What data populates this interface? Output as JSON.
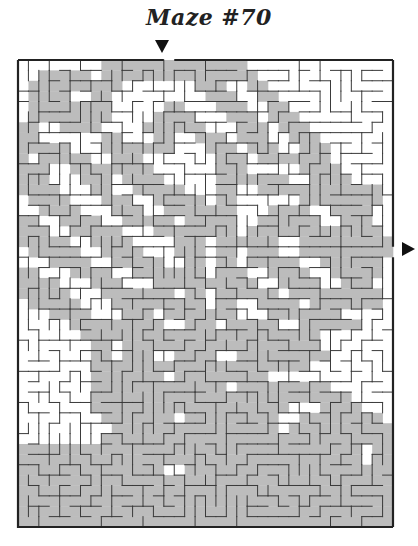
{
  "title": "Maze #70",
  "maze": {
    "cols": 36,
    "rows": 45,
    "cell_px": 10.4,
    "entrance": {
      "side": "top",
      "col": 14,
      "icon": "arrow-down-icon"
    },
    "exit": {
      "side": "right",
      "row": 18,
      "icon": "arrow-right-icon"
    },
    "colors": {
      "wall": "#3a3a3a",
      "border": "#222222",
      "shade": "#bcbcbc",
      "background": "#ffffff"
    },
    "shade_rows": [
      "000000002222222222222200000000000000",
      "002222202222222222222220000000000000",
      "022222222200000002220022000000000000",
      "022220022000000000222002200000000000",
      "022222222000002200022200220000000000",
      "022222222000022220002220222000000000",
      "220022220000222222000222022200000000",
      "220000002200022002220222002220000000",
      "222220002222222000222022200222000000",
      "202222200222000000022202222222000000",
      "222002222222200000022200000222200000",
      "222000222022220000022222220022220000",
      "222200022002222200022002222222222220",
      "022220002220022222022000000222222220",
      "002222000222002222222000222200222200",
      "220022220022222022222002222220022200",
      "222002222200022222222022222222222220",
      "222220022220000222022222200222222222",
      "022222002222000222022022200222222222",
      "000222200222220022022022222002222220",
      "220002222002222222022200222200222220",
      "222200022200022222222220022220022200",
      "222220002222222022022222202222222220",
      "022222000222222222022002222022222220",
      "000222200022202222222000222222200000",
      "000002222222220022202222200222222000",
      "000000222222222222222222222220000000",
      "000000022022222222222222222220000000",
      "000000022022200222200222222222000000",
      "000000022222222222222222222200000000",
      "000000022222220222222222000000000000",
      "000000022222222222220222222222000000",
      "000000022222222222222222222222220000",
      "000000022222222222222222220002222000",
      "000000002222222022222222200222222220",
      "000000000222222222222222202222222222",
      "000000002222222222222222222222222222",
      "222222222222222222222222222222222022",
      "222222222222222222222222222222222022",
      "222222222222220022222222222222222222",
      "222222222222222222222222222222222222",
      "222222222222222222222222222222222222",
      "222222222222222222222222222222222222",
      "222222222222222222222222222222222222",
      "222222222222222222222222222222222222"
    ],
    "seed": 70
  }
}
